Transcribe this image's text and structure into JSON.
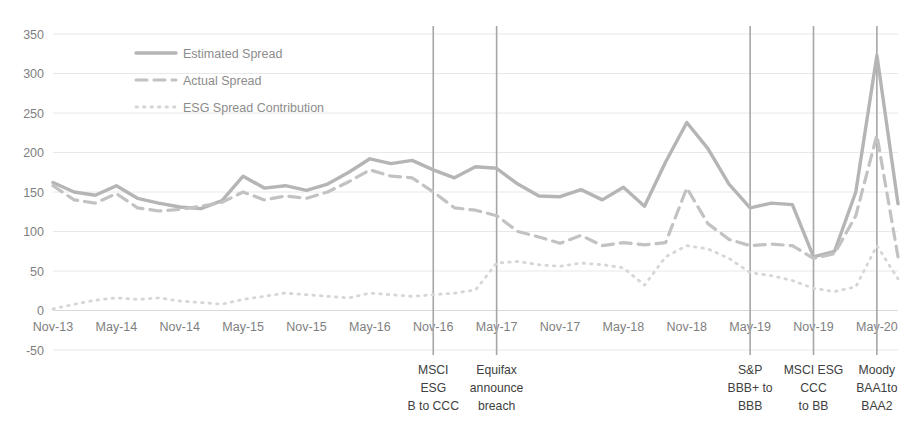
{
  "chart_data": {
    "type": "line",
    "title": "",
    "xlabel": "",
    "ylabel": "",
    "ylim": [
      -50,
      350
    ],
    "yticks": [
      -50,
      0,
      50,
      100,
      150,
      200,
      250,
      300,
      350
    ],
    "grid": true,
    "legend_position": "top-left-inside",
    "x_tick_labels": [
      "Nov-13",
      "May-14",
      "Nov-14",
      "May-15",
      "Nov-15",
      "May-16",
      "Nov-16",
      "May-17",
      "Nov-17",
      "May-18",
      "Nov-18",
      "May-19",
      "Nov-19",
      "May-20"
    ],
    "x": [
      "Nov-13",
      "Jan-14",
      "Mar-14",
      "May-14",
      "Jul-14",
      "Sep-14",
      "Nov-14",
      "Jan-15",
      "Mar-15",
      "May-15",
      "Jul-15",
      "Sep-15",
      "Nov-15",
      "Jan-16",
      "Mar-16",
      "May-16",
      "Jul-16",
      "Sep-16",
      "Nov-16",
      "Jan-17",
      "Mar-17",
      "May-17",
      "Jul-17",
      "Sep-17",
      "Nov-17",
      "Jan-18",
      "Mar-18",
      "May-18",
      "Jul-18",
      "Sep-18",
      "Nov-18",
      "Jan-19",
      "Mar-19",
      "May-19",
      "Jul-19",
      "Sep-19",
      "Nov-19",
      "Jan-20",
      "Mar-20",
      "May-20",
      "Jul-20"
    ],
    "series": [
      {
        "name": "Estimated Spread",
        "style": "solid",
        "color": "#b5b5b5",
        "values": [
          162,
          150,
          146,
          158,
          142,
          136,
          131,
          129,
          139,
          170,
          155,
          158,
          152,
          160,
          175,
          192,
          186,
          190,
          178,
          168,
          182,
          180,
          160,
          145,
          144,
          153,
          140,
          156,
          132,
          188,
          238,
          205,
          160,
          130,
          136,
          134,
          68,
          75,
          150,
          323,
          135
        ]
      },
      {
        "name": "Actual Spread",
        "style": "dashed",
        "color": "#c2c2c2",
        "values": [
          158,
          140,
          136,
          148,
          130,
          126,
          128,
          132,
          137,
          150,
          140,
          145,
          142,
          150,
          163,
          178,
          170,
          168,
          150,
          130,
          127,
          120,
          100,
          93,
          85,
          95,
          82,
          86,
          83,
          86,
          155,
          110,
          90,
          82,
          84,
          82,
          66,
          72,
          120,
          222,
          68
        ]
      },
      {
        "name": "ESG Spread Contribution",
        "style": "dotted",
        "color": "#d6d6d6",
        "values": [
          2,
          8,
          13,
          16,
          14,
          16,
          12,
          10,
          8,
          14,
          18,
          22,
          20,
          18,
          16,
          22,
          20,
          18,
          20,
          22,
          26,
          60,
          62,
          58,
          56,
          60,
          58,
          54,
          32,
          68,
          82,
          78,
          66,
          48,
          44,
          38,
          28,
          24,
          30,
          82,
          40
        ]
      }
    ],
    "annotations": [
      {
        "x_position": "Nov-16",
        "lines": [
          "MSCI",
          "ESG",
          "B to CCC"
        ]
      },
      {
        "x_position": "May-17",
        "lines": [
          "Equifax",
          "announce",
          "breach"
        ]
      },
      {
        "x_position": "May-19",
        "lines": [
          "S&P",
          "BBB+ to",
          "BBB"
        ]
      },
      {
        "x_position": "Nov-19",
        "lines": [
          "MSCI ESG",
          "CCC",
          "to BB"
        ]
      },
      {
        "x_position": "May-20",
        "lines": [
          "Moody",
          "BAA1to",
          "BAA2"
        ]
      }
    ]
  }
}
